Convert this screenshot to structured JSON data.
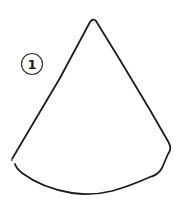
{
  "figure": {
    "label": "1",
    "shape": "cone-sector",
    "stroke_color": "#1e1e1e",
    "background": "#ffffff"
  }
}
